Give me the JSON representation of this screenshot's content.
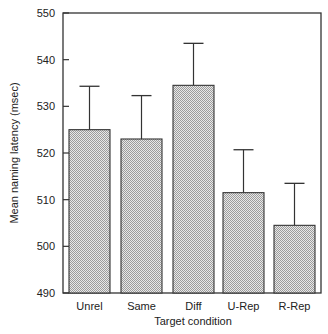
{
  "chart_data": {
    "type": "bar",
    "title": "",
    "xlabel": "Target condition",
    "ylabel": "Mean naming latency (msec)",
    "categories": [
      "Unrel",
      "Same",
      "Diff",
      "U-Rep",
      "R-Rep"
    ],
    "values": [
      525,
      523,
      534.5,
      511.5,
      504.5
    ],
    "error_upper": [
      534.3,
      532.3,
      543.5,
      520.7,
      513.5
    ],
    "ylim": [
      490,
      550
    ],
    "yticks": [
      490,
      500,
      510,
      520,
      530,
      540,
      550
    ],
    "grid": false,
    "legend": null,
    "bar_fill": "stippled gray",
    "error_bars": "upper only"
  },
  "colors": {
    "frame": "#333333",
    "bar_fill_light": "#e6e6e6",
    "bar_fill_dark": "#a8a8a8",
    "bar_edge": "#333333"
  }
}
